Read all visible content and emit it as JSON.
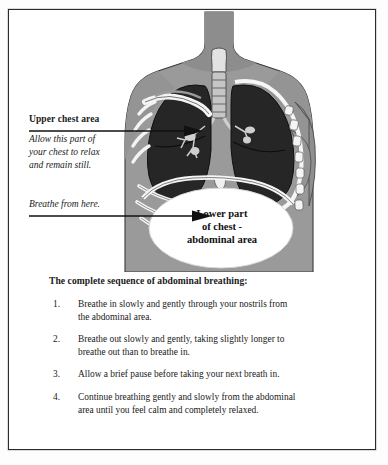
{
  "figure": {
    "alt_title": "Abdominal breathing anatomy diagram",
    "colors": {
      "skin": "#9a9a9a",
      "skin_shadow": "#8a8a8a",
      "lung": "#262626",
      "bone": "#f4f4f4",
      "trachea": "#c6c6c6",
      "outline": "#1f1f1f",
      "background": "#ffffff"
    },
    "parts": [
      "neck",
      "shoulders",
      "torso",
      "trachea",
      "left-lung",
      "right-lung",
      "bronchial-tree",
      "clavicle",
      "ribs",
      "diaphragm",
      "abdominal-cavity"
    ]
  },
  "upper_callout": {
    "title": "Upper chest area",
    "body_lines": [
      "Allow this part of",
      "your chest to relax",
      "and remain still."
    ]
  },
  "lower_callout": {
    "body_lines": [
      "Breathe from here."
    ]
  },
  "abdomen_label": {
    "lines": [
      "Lower part",
      "of chest -",
      "abdominal area"
    ]
  },
  "instructions": {
    "heading": "The complete sequence of abdominal breathing:",
    "steps": [
      {
        "number": "1.",
        "lines": [
          "Breathe in slowly and gently through your nostrils from",
          "the abdominal area."
        ]
      },
      {
        "number": "2.",
        "lines": [
          "Breathe out slowly and gently, taking slightly longer to",
          "breathe out than to breathe in."
        ]
      },
      {
        "number": "3.",
        "lines": [
          "Allow a brief pause before taking your next breath in."
        ]
      },
      {
        "number": "4.",
        "lines": [
          "Continue breathing gently and slowly from the abdominal",
          "area until you feel calm and completely relaxed."
        ]
      }
    ]
  }
}
